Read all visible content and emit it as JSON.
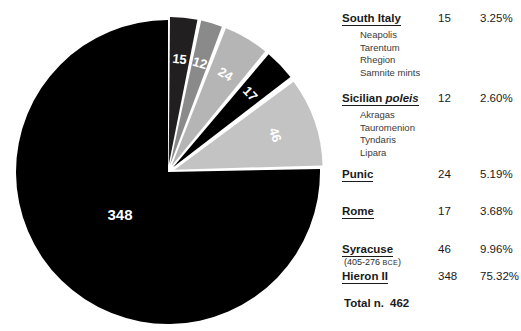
{
  "chart_data": {
    "type": "pie",
    "title": "",
    "total_label": "Total n.",
    "total_value": "462",
    "total": 462,
    "categories": [
      "South Italy",
      "Sicilian poleis",
      "Punic",
      "Rome",
      "Syracuse",
      "Hieron II"
    ],
    "values": [
      15,
      12,
      24,
      17,
      46,
      348
    ],
    "percents": [
      "3.25%",
      "2.60%",
      "5.19%",
      "3.68%",
      "9.96%",
      "75.32%"
    ],
    "percent_values": [
      3.25,
      2.6,
      5.19,
      3.68,
      9.96,
      75.32
    ],
    "slice_labels": [
      "15",
      "12",
      "24",
      "17",
      "46",
      "348"
    ],
    "colors": [
      "#221f20",
      "#8a8a8a",
      "#b5b5b5",
      "#000000",
      "#c3c3c3",
      "#000000"
    ],
    "exploded": [
      true,
      true,
      true,
      true,
      true,
      false
    ],
    "legend_position": "right",
    "grid": false,
    "start_angle_deg": -90,
    "direction": "clockwise"
  },
  "pie": {
    "slices": [
      {
        "name": "South Italy",
        "label": "15",
        "color": "#221f20",
        "value": 15,
        "label_color": "#ffffff"
      },
      {
        "name": "Sicilian poleis",
        "label": "12",
        "color": "#8a8a8a",
        "value": 12,
        "label_color": "#ffffff"
      },
      {
        "name": "Punic",
        "label": "24",
        "color": "#b5b5b5",
        "value": 24,
        "label_color": "#ffffff"
      },
      {
        "name": "Rome",
        "label": "17",
        "color": "#000000",
        "value": 17,
        "label_color": "#ffffff"
      },
      {
        "name": "Syracuse",
        "label": "46",
        "color": "#c3c3c3",
        "value": 46,
        "label_color": "#ffffff"
      },
      {
        "name": "Hieron II",
        "label": "348",
        "color": "#000000",
        "value": 348,
        "label_color": "#ffffff"
      }
    ]
  },
  "legend": {
    "rows": [
      {
        "name_main": "South Italy",
        "name_italic": "",
        "count": "15",
        "percent": "3.25%",
        "subitems": [
          "Neapolis",
          "Tarentum",
          "Rhegion",
          "Samnite mints"
        ],
        "daterange": ""
      },
      {
        "name_main": "Sicilian ",
        "name_italic": "poleis",
        "count": "12",
        "percent": "2.60%",
        "subitems": [
          "Akragas",
          "Tauromenion",
          "Tyndaris",
          "Lipara"
        ],
        "daterange": ""
      },
      {
        "name_main": "Punic",
        "name_italic": "",
        "count": "24",
        "percent": "5.19%",
        "subitems": [],
        "daterange": ""
      },
      {
        "name_main": "Rome",
        "name_italic": "",
        "count": "17",
        "percent": "3.68%",
        "subitems": [],
        "daterange": ""
      },
      {
        "name_main": "Syracuse",
        "name_italic": "",
        "count": "46",
        "percent": "9.96%",
        "subitems": [],
        "daterange": "(405-276 BCE)",
        "daterange_prefix": "(405-276 ",
        "daterange_smallcaps": "BCE",
        "daterange_suffix": ")"
      },
      {
        "name_main": "Hieron II",
        "name_italic": "",
        "count": "348",
        "percent": "75.32%",
        "subitems": [],
        "daterange": ""
      }
    ],
    "total_label": "Total n.",
    "total_value": "462"
  }
}
